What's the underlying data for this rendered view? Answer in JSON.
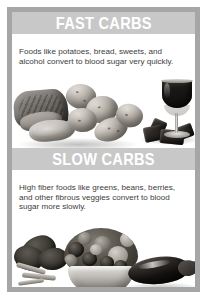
{
  "infographic": {
    "sections": [
      {
        "id": "fast-carbs",
        "heading": "FAST CARBS",
        "body": "Foods like potatoes, bread, sweets, and alcohol convert to blood sugar very quickly.",
        "foods_depicted": [
          "bread loaf",
          "bread slices",
          "potatoes",
          "glass of red wine",
          "chocolate pieces"
        ]
      },
      {
        "id": "slow-carbs",
        "heading": "SLOW CARBS",
        "body": "High fiber foods like greens, beans, berries, and other fibrous veggies convert to blood sugar more slowly.",
        "foods_depicted": [
          "kale greens",
          "bowl of berries",
          "eggplant"
        ]
      }
    ]
  },
  "colors": {
    "frame": "#a6a6a6",
    "band_background": "#c8c8c8",
    "band_text": "#ffffff",
    "body_text": "#3d3d3d",
    "page_background": "#ffffff"
  }
}
